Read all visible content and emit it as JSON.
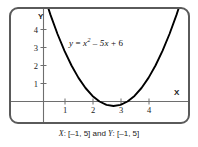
{
  "chart_data": {
    "type": "line",
    "title": "",
    "equation_display": "y = x² – 5x + 6",
    "equation_parts": {
      "lhs": "y",
      "equals": "=",
      "var": "x",
      "power": "2",
      "minus": "–",
      "linear_term": "5x",
      "plus": "+",
      "constant": "6"
    },
    "function": "y = x^2 - 5x + 6",
    "xlabel": "X",
    "ylabel": "Y",
    "xlim": [
      -1,
      5
    ],
    "ylim": [
      -1,
      5
    ],
    "xticks": [
      1,
      2,
      3,
      4
    ],
    "xtick_labels": [
      "1",
      "2",
      "3",
      "4"
    ],
    "yticks": [
      1,
      2,
      3,
      4
    ],
    "ytick_labels": [
      "1",
      "2",
      "3",
      "4"
    ],
    "grid": false,
    "legend": false,
    "roots": [
      2,
      3
    ],
    "vertex": [
      2.5,
      -0.25
    ],
    "y_intercept": 6,
    "x": [
      -1,
      -0.75,
      -0.5,
      -0.25,
      0,
      0.25,
      0.5,
      0.75,
      1,
      1.25,
      1.5,
      1.75,
      2,
      2.25,
      2.5,
      2.75,
      3,
      3.25,
      3.5,
      3.75,
      4,
      4.25,
      4.5,
      4.75,
      5
    ],
    "y": [
      12,
      10.3125,
      8.75,
      7.3125,
      6,
      4.8125,
      3.75,
      2.8125,
      2,
      1.3125,
      0.75,
      0.3125,
      0,
      -0.1875,
      -0.25,
      -0.1875,
      0,
      0.3125,
      0.75,
      1.3125,
      2,
      2.8125,
      3.75,
      4.8125,
      6
    ],
    "curve_color": "#000000",
    "axis_color": "#6e6e6e",
    "frame_color": "#5a5a5a",
    "background": "#ffffff"
  },
  "caption": {
    "x_prefix": "X",
    "x_range": ": [–1, 5] and ",
    "y_prefix": "Y",
    "y_range": ": [–1, 5]",
    "full": "X: [–1, 5] and Y: [–1, 5]"
  },
  "axes": {
    "x_name": "X",
    "y_name": "Y"
  },
  "x_tick_labels": [
    "1",
    "2",
    "3",
    "4"
  ],
  "y_tick_labels": [
    "1",
    "2",
    "3",
    "4"
  ]
}
